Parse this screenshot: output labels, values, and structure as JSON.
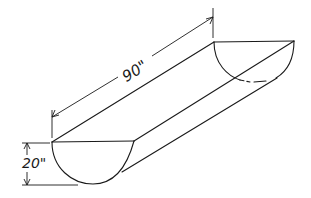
{
  "figure": {
    "shape": "half-cylinder trough",
    "length_label": "90\"",
    "height_label": "20\"",
    "colors": {
      "ink": "#1a1a1a",
      "background": "#ffffff"
    }
  }
}
